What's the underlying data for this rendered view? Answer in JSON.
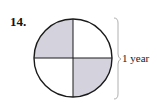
{
  "problem": {
    "number": "14.",
    "label": "1 year"
  },
  "diagram": {
    "type": "circle-quarters",
    "shaded_quarters": [
      "top-left",
      "bottom-right"
    ],
    "shade_color": "#d4d2dc",
    "stroke_color": "#1a1a1a",
    "brace_color": "#b0b0b0"
  }
}
